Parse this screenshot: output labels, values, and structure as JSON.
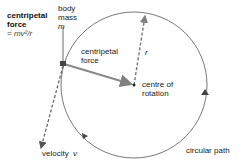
{
  "labels": {
    "centripetal_force_title_1": "centripetal",
    "centripetal_force_title_2": "force",
    "centripetal_force_formula": "= mv²/r",
    "body_1": "body",
    "body_2": "mass",
    "body_3": "m",
    "force_arrow_1": "centripetal",
    "force_arrow_2": "force",
    "radius": "r",
    "centre_1": "centre of",
    "centre_2": "rotation",
    "velocity": "velocity",
    "velocity_symbol": "v",
    "path": "circular path"
  },
  "colors": {
    "circle": "#555555",
    "force_arrow": "#808080",
    "dashed": "#666666",
    "text": "#222222"
  }
}
